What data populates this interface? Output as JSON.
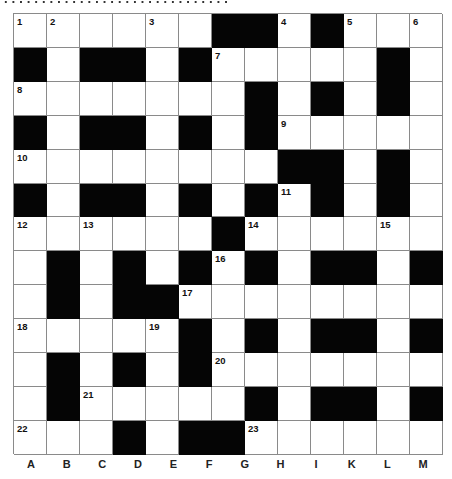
{
  "puzzle": {
    "type": "crossword",
    "rows": 13,
    "cols": 13,
    "grid": [
      [
        "1",
        "2",
        "",
        "",
        "3",
        "",
        "#",
        "#",
        "4",
        "#",
        "5",
        "",
        "6"
      ],
      [
        "#",
        "",
        "#",
        "#",
        "",
        "#",
        "7",
        "",
        "",
        "",
        "",
        "#",
        ""
      ],
      [
        "8",
        "",
        "",
        "",
        "",
        "",
        "",
        "#",
        "",
        "#",
        "",
        "#",
        ""
      ],
      [
        "#",
        "",
        "#",
        "#",
        "",
        "#",
        "",
        "#",
        "9",
        "",
        "",
        "",
        ""
      ],
      [
        "10",
        "",
        "",
        "",
        "",
        "",
        "",
        "",
        "#",
        "#",
        "",
        "#",
        ""
      ],
      [
        "#",
        "",
        "#",
        "#",
        "",
        "#",
        "",
        "#",
        "11",
        "#",
        "",
        "#",
        ""
      ],
      [
        "12",
        "",
        "13",
        "",
        "",
        "",
        "#",
        "14",
        "",
        "",
        "",
        "15",
        ""
      ],
      [
        "",
        "#",
        "",
        "#",
        "",
        "#",
        "16",
        "#",
        "",
        "#",
        "#",
        "",
        "#"
      ],
      [
        "",
        "#",
        "",
        "#",
        "#",
        "17",
        "",
        "",
        "",
        "",
        "",
        "",
        ""
      ],
      [
        "18",
        "",
        "",
        "",
        "19",
        "#",
        "",
        "#",
        "",
        "#",
        "#",
        "",
        "#"
      ],
      [
        "",
        "#",
        "",
        "#",
        "",
        "#",
        "20",
        "",
        "",
        "",
        "",
        "",
        ""
      ],
      [
        "",
        "#",
        "21",
        "",
        "",
        "",
        "",
        "#",
        "",
        "#",
        "#",
        "",
        "#"
      ],
      [
        "22",
        "",
        "",
        "#",
        "",
        "#",
        "#",
        "23",
        "",
        "",
        "",
        "",
        ""
      ]
    ]
  },
  "column_labels": [
    "A",
    "B",
    "C",
    "D",
    "E",
    "F",
    "G",
    "H",
    "I",
    "K",
    "L",
    "M"
  ],
  "colors": {
    "block": "#050505",
    "cell": "#ffffff",
    "grid_line": "#8a8a8a"
  }
}
